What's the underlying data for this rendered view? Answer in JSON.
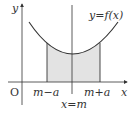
{
  "diagram": {
    "axes": {
      "x_label": "x",
      "y_label": "y",
      "origin_label": "O"
    },
    "curve_label": "y=f(x)",
    "markers": {
      "left": "m−a",
      "right": "m+a",
      "center": "x=m"
    },
    "colors": {
      "stroke": "#333333",
      "fill": "#e3e3e3"
    }
  }
}
